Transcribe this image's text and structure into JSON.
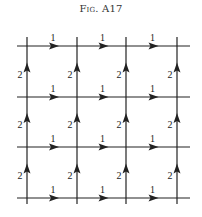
{
  "figure": {
    "title": "Fig. A17"
  },
  "grid": {
    "vertical_x": [
      27,
      77,
      126,
      177
    ],
    "horizontal_y": [
      46,
      97,
      147,
      198
    ],
    "h_extent": [
      17,
      190
    ],
    "v_extent": [
      37,
      204
    ],
    "line_color": "#222222"
  },
  "edges": {
    "horizontal_label": "1",
    "horizontal_direction": "right",
    "vertical_label": "2",
    "vertical_direction": "up",
    "horizontal_arrows_per_row": 3,
    "vertical_arrows_per_column": 3
  },
  "labels": {
    "h": [
      [
        "1",
        "1",
        "1"
      ],
      [
        "1",
        "1",
        "1"
      ],
      [
        "1",
        "1",
        "1"
      ],
      [
        "1",
        "1",
        "1"
      ]
    ],
    "v": [
      [
        "2",
        "2",
        "2",
        "2"
      ],
      [
        "2",
        "2",
        "2",
        "2"
      ],
      [
        "2",
        "2",
        "2",
        "2"
      ]
    ]
  }
}
